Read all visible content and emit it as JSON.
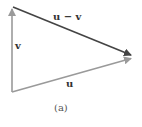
{
  "diagram": {
    "vectors": [
      {
        "name": "v",
        "label": "v",
        "from": [
          12,
          92
        ],
        "to": [
          12,
          8
        ],
        "color": "#9a9a9a"
      },
      {
        "name": "u",
        "label": "u",
        "from": [
          12,
          92
        ],
        "to": [
          132,
          58
        ],
        "color": "#9a9a9a"
      },
      {
        "name": "u-minus-v",
        "label": "u − v",
        "from": [
          12,
          8
        ],
        "to": [
          132,
          55
        ],
        "color": "#444444"
      }
    ],
    "caption": "(a)"
  }
}
